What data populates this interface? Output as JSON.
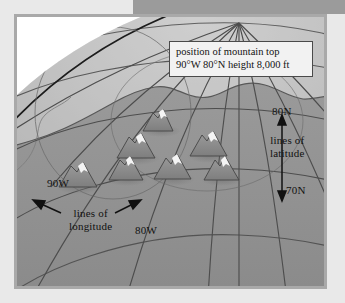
{
  "diagram": {
    "callout": {
      "line1": "position of mountain top",
      "line2": "90°W 80°N  height 8,000 ft"
    },
    "labels": {
      "lat_80n": "80N",
      "lat_70n": "70N",
      "lat_caption_line1": "lines of",
      "lat_caption_line2": "latitude",
      "lon_90w": "90W",
      "lon_80w": "80W",
      "lon_caption_line1": "lines of",
      "lon_caption_line2": "longitude"
    },
    "colors": {
      "page_background": "#e9e9e9",
      "top_block": "#9b9b9b",
      "panel_border": "#a9a9a9",
      "ocean": "#b4b4b4",
      "land": "#8e8e8e",
      "globe_far": "#d6d6d6",
      "outside_globe": "#ffffff",
      "grid_line": "#4d4d4d",
      "callout_background": "#f2f2f2",
      "callout_border": "#4a4a4a",
      "text": "#111111",
      "mountain_body": "#8a8a8a",
      "mountain_peak": "#f4f4f4",
      "mountain_shadow": "#7a7a7a"
    },
    "mountains": [
      {
        "x": 126,
        "y": 96,
        "w": 30,
        "h": 22
      },
      {
        "x": 104,
        "y": 120,
        "w": 34,
        "h": 25
      },
      {
        "x": 176,
        "y": 118,
        "w": 33,
        "h": 25
      },
      {
        "x": 95,
        "y": 140,
        "w": 30,
        "h": 22
      },
      {
        "x": 140,
        "y": 138,
        "w": 32,
        "h": 24
      },
      {
        "x": 190,
        "y": 140,
        "w": 31,
        "h": 23
      },
      {
        "x": 52,
        "y": 146,
        "w": 32,
        "h": 24
      }
    ],
    "grid": {
      "pole_x": 222,
      "pole_y": 6,
      "meridian_count": 9,
      "parallel_count": 5,
      "named_parallels": [
        "80N",
        "70N"
      ],
      "named_meridians": [
        "90W",
        "80W"
      ]
    }
  }
}
